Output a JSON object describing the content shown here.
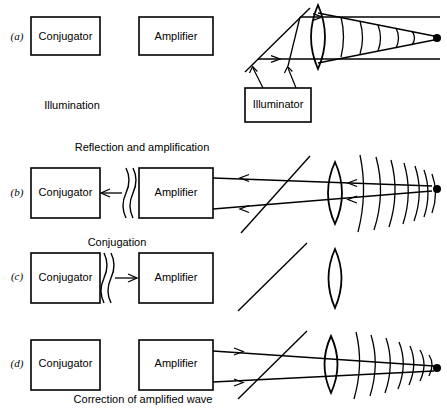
{
  "figure": {
    "title_present": false,
    "width": 447,
    "height": 410,
    "ink_color": "#000000",
    "background_color": "#ffffff"
  },
  "labels": {
    "conjugator": "Conjugator",
    "amplifier": "Amplifier",
    "illuminator": "Illuminator"
  },
  "panels": [
    {
      "tag": "(a)",
      "caption": "Illumination",
      "caption_position": "below-left",
      "boxes": [
        "Conjugator",
        "Amplifier",
        "Illuminator"
      ],
      "optics": [
        "beam-splitter",
        "lens",
        "diverging-wavefronts",
        "focal-point"
      ],
      "beam_direction": "left-to-right",
      "wavefront_count": 5
    },
    {
      "tag": "(b)",
      "caption": "Reflection and amplification",
      "caption_position": "above",
      "boxes": [
        "Conjugator",
        "Amplifier"
      ],
      "optics": [
        "beam-splitter",
        "lens",
        "aberrated-wavefronts",
        "focal-point"
      ],
      "beam_direction": "right-to-left",
      "wavefront_count": 7
    },
    {
      "tag": "(c)",
      "caption": "Conjugation",
      "caption_position": "above",
      "boxes": [
        "Conjugator",
        "Amplifier"
      ],
      "optics": [
        "beam-splitter",
        "lens"
      ],
      "beam_direction": "left-to-right",
      "wavefront_count": 0
    },
    {
      "tag": "(d)",
      "caption": "Correction of amplified wave",
      "caption_position": "below",
      "boxes": [
        "Conjugator",
        "Amplifier"
      ],
      "optics": [
        "beam-splitter",
        "lens",
        "corrected-wavefronts",
        "focal-point"
      ],
      "beam_direction": "left-to-right",
      "wavefront_count": 7
    }
  ],
  "symbols": {
    "wavy_pair": "phase-conjugate-wave-symbol",
    "arrow_left": "leftward-arrow",
    "arrow_right": "rightward-arrow",
    "focal_point": "filled-dot",
    "lens": "biconvex-lens",
    "beam_splitter": "diagonal-beam-splitter"
  }
}
